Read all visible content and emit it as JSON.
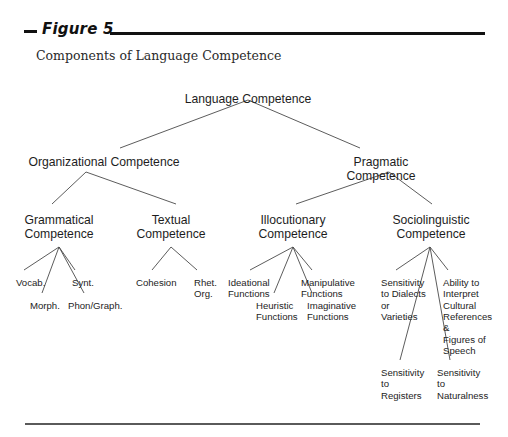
{
  "figure": {
    "label": "Figure 5",
    "subtitle": "Components of Language Competence"
  },
  "colors": {
    "ink": "#1d1d1d",
    "rule": "#111111",
    "rule_bottom": "#5a5a5a",
    "line": "#4a4a4a",
    "background": "#ffffff"
  },
  "chart_data": {
    "type": "diagram",
    "title": "Components of Language Competence",
    "diagram_kind": "hierarchy-tree",
    "nodes": [
      {
        "id": "root",
        "label": "Language Competence",
        "level": 0,
        "x": 248,
        "y": 92
      },
      {
        "id": "org",
        "label": "Organizational Competence",
        "level": 1,
        "x": 104,
        "y": 155
      },
      {
        "id": "prag",
        "label": "Pragmatic Competence",
        "level": 1,
        "x": 381,
        "y": 155
      },
      {
        "id": "gram",
        "label": "Grammatical\nCompetence",
        "level": 2,
        "x": 59,
        "y": 213
      },
      {
        "id": "text",
        "label": "Textual\nCompetence",
        "level": 2,
        "x": 171,
        "y": 213
      },
      {
        "id": "illoc",
        "label": "Illocutionary\nCompetence",
        "level": 2,
        "x": 293,
        "y": 213
      },
      {
        "id": "socio",
        "label": "Sociolinguistic\nCompetence",
        "level": 2,
        "x": 431,
        "y": 213
      },
      {
        "id": "vocab",
        "label": "Vocab.",
        "level": 3,
        "x": 16,
        "y": 277
      },
      {
        "id": "morph",
        "label": "Morph.",
        "level": 3,
        "x": 30,
        "y": 300
      },
      {
        "id": "synt",
        "label": "Synt.",
        "level": 3,
        "x": 72,
        "y": 277
      },
      {
        "id": "phon",
        "label": "Phon/Graph.",
        "level": 3,
        "x": 68,
        "y": 300
      },
      {
        "id": "cohesion",
        "label": "Cohesion",
        "level": 3,
        "x": 136,
        "y": 277
      },
      {
        "id": "rhet",
        "label": "Rhet.\nOrg.",
        "level": 3,
        "x": 194,
        "y": 277
      },
      {
        "id": "ideational",
        "label": "Ideational\nFunctions",
        "level": 3,
        "x": 228,
        "y": 277
      },
      {
        "id": "heuristic",
        "label": "Heuristic\nFunctions",
        "level": 3,
        "x": 256,
        "y": 300
      },
      {
        "id": "manip",
        "label": "Manipulative\nFunctions",
        "level": 3,
        "x": 301,
        "y": 277
      },
      {
        "id": "imag",
        "label": "Imaginative\nFunctions",
        "level": 3,
        "x": 307,
        "y": 300
      },
      {
        "id": "dialects",
        "label": "Sensitivity\nto Dialects\nor\nVarieties",
        "level": 3,
        "x": 381,
        "y": 277
      },
      {
        "id": "cultural",
        "label": "Ability to\nInterpret\nCultural\nReferences\n&\nFigures of\nSpeech",
        "level": 3,
        "x": 443,
        "y": 277
      },
      {
        "id": "registers",
        "label": "Sensitivity\nto\nRegisters",
        "level": 3,
        "x": 381,
        "y": 367
      },
      {
        "id": "natural",
        "label": "Sensitivity\nto\nNaturalness",
        "level": 3,
        "x": 437,
        "y": 367
      }
    ],
    "edges": [
      {
        "from": "root",
        "to": "org"
      },
      {
        "from": "root",
        "to": "prag"
      },
      {
        "from": "org",
        "to": "gram"
      },
      {
        "from": "org",
        "to": "text"
      },
      {
        "from": "prag",
        "to": "illoc"
      },
      {
        "from": "prag",
        "to": "socio"
      },
      {
        "from": "gram",
        "to": "vocab"
      },
      {
        "from": "gram",
        "to": "morph"
      },
      {
        "from": "gram",
        "to": "synt"
      },
      {
        "from": "gram",
        "to": "phon"
      },
      {
        "from": "text",
        "to": "cohesion"
      },
      {
        "from": "text",
        "to": "rhet"
      },
      {
        "from": "illoc",
        "to": "ideational"
      },
      {
        "from": "illoc",
        "to": "heuristic"
      },
      {
        "from": "illoc",
        "to": "manip"
      },
      {
        "from": "illoc",
        "to": "imag"
      },
      {
        "from": "socio",
        "to": "dialects"
      },
      {
        "from": "socio",
        "to": "cultural"
      },
      {
        "from": "socio",
        "to": "registers"
      },
      {
        "from": "socio",
        "to": "natural"
      }
    ]
  }
}
